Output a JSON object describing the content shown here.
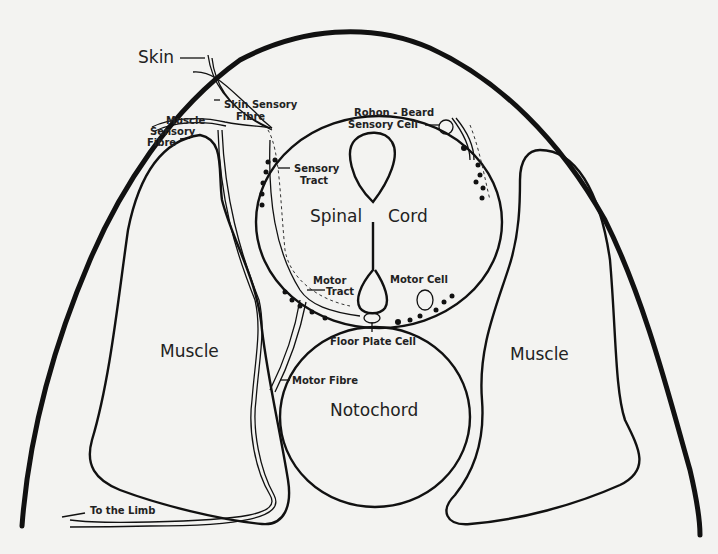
{
  "diagram": {
    "labels": {
      "skin": "Skin",
      "skin_sensory_fibre_1": "Skin Sensory",
      "skin_sensory_fibre_2": "Fibre",
      "muscle_sensory_fibre_1": "Muscle",
      "muscle_sensory_fibre_2": "Sensory",
      "muscle_sensory_fibre_3": "Fibre",
      "rohon_beard_1": "Rohon - Beard",
      "rohon_beard_2": "Sensory Cell",
      "sensory_tract_1": "Sensory",
      "sensory_tract_2": "Tract",
      "spinal_cord_1": "Spinal",
      "spinal_cord_2": "Cord",
      "motor_tract_1": "Motor",
      "motor_tract_2": "Tract",
      "motor_cell": "Motor Cell",
      "floor_plate_cell": "Floor Plate Cell",
      "muscle_left": "Muscle",
      "muscle_right": "Muscle",
      "motor_fibre": "Motor Fibre",
      "notochord": "Notochord",
      "to_the_limb": "To the Limb"
    },
    "colors": {
      "ink": "#111111",
      "paper": "#f3f3f1"
    }
  }
}
